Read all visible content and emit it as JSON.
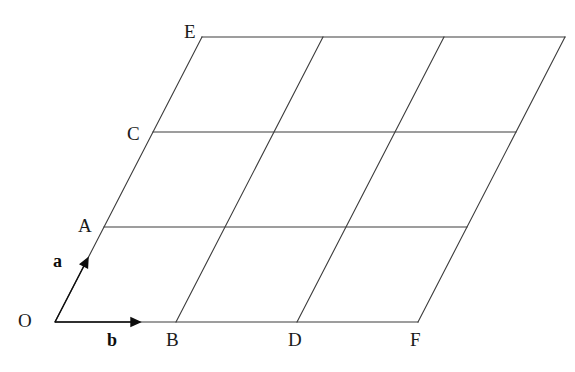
{
  "figure": {
    "type": "geometry-diagram",
    "width": 575,
    "height": 372,
    "background_color": "#ffffff",
    "line_color": "#3c3c3c",
    "line_width": 1.1,
    "text_color": "#1a1a1a"
  },
  "lattice": {
    "origin": {
      "x": 55,
      "y": 322
    },
    "vector_a": {
      "dx": 49,
      "dy": -95,
      "label": "a",
      "steps": 3
    },
    "vector_b": {
      "dx": 121,
      "dy": 0,
      "label": "b",
      "steps": 3
    },
    "rows": 3,
    "columns": 3,
    "grid_lines_a_count": 4,
    "grid_lines_b_count": 4
  },
  "arrows": {
    "a_arrow": {
      "name": "a",
      "from": {
        "x": 55,
        "y": 322
      },
      "to": {
        "x": 88,
        "y": 258
      },
      "head_size": 9
    },
    "b_arrow": {
      "name": "b",
      "from": {
        "x": 55,
        "y": 322
      },
      "to": {
        "x": 140,
        "y": 322
      },
      "head_size": 9
    }
  },
  "vertex_labels": [
    {
      "id": "O",
      "text": "O",
      "x": 18,
      "y": 311,
      "point": {
        "x": 55,
        "y": 322
      }
    },
    {
      "id": "A",
      "text": "A",
      "x": 78,
      "y": 216,
      "point": {
        "x": 104,
        "y": 227
      }
    },
    {
      "id": "C",
      "text": "C",
      "x": 127,
      "y": 124,
      "point": {
        "x": 153,
        "y": 132
      }
    },
    {
      "id": "E",
      "text": "E",
      "x": 184,
      "y": 22,
      "point": {
        "x": 202,
        "y": 47
      }
    },
    {
      "id": "B",
      "text": "B",
      "x": 166,
      "y": 330,
      "point": {
        "x": 176,
        "y": 322
      }
    },
    {
      "id": "D",
      "text": "D",
      "x": 288,
      "y": 330,
      "point": {
        "x": 297,
        "y": 322
      }
    },
    {
      "id": "F",
      "text": "F",
      "x": 410,
      "y": 330,
      "point": {
        "x": 418,
        "y": 322
      }
    }
  ],
  "vector_labels": [
    {
      "id": "a",
      "text": "a",
      "x": 53,
      "y": 252
    },
    {
      "id": "b",
      "text": "b",
      "x": 107,
      "y": 331
    }
  ]
}
